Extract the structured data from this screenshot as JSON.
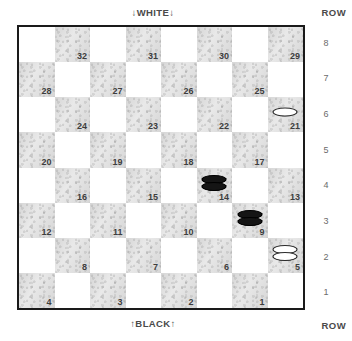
{
  "board": {
    "top_label": "↓WHITE↓",
    "bottom_label": "↑BLACK↑",
    "row_word_top": "ROW",
    "row_word_bottom": "ROW",
    "row_numbers": [
      "8",
      "7",
      "6",
      "5",
      "4",
      "3",
      "2",
      "1"
    ],
    "columns": 8,
    "rows": 8,
    "border_color": "#1a1a1a",
    "dark_square_color": "#e9e9e9",
    "light_square_color": "#ffffff",
    "square_number_color": "#3d3d3d",
    "squares": [
      {
        "num": "32",
        "row": 8,
        "col": 2
      },
      {
        "num": "31",
        "row": 8,
        "col": 4
      },
      {
        "num": "30",
        "row": 8,
        "col": 6
      },
      {
        "num": "29",
        "row": 8,
        "col": 8
      },
      {
        "num": "28",
        "row": 7,
        "col": 1
      },
      {
        "num": "27",
        "row": 7,
        "col": 3
      },
      {
        "num": "26",
        "row": 7,
        "col": 5
      },
      {
        "num": "25",
        "row": 7,
        "col": 7
      },
      {
        "num": "24",
        "row": 6,
        "col": 2
      },
      {
        "num": "23",
        "row": 6,
        "col": 4
      },
      {
        "num": "22",
        "row": 6,
        "col": 6
      },
      {
        "num": "21",
        "row": 6,
        "col": 8
      },
      {
        "num": "20",
        "row": 5,
        "col": 1
      },
      {
        "num": "19",
        "row": 5,
        "col": 3
      },
      {
        "num": "18",
        "row": 5,
        "col": 5
      },
      {
        "num": "17",
        "row": 5,
        "col": 7
      },
      {
        "num": "16",
        "row": 4,
        "col": 2
      },
      {
        "num": "15",
        "row": 4,
        "col": 4
      },
      {
        "num": "14",
        "row": 4,
        "col": 6
      },
      {
        "num": "13",
        "row": 4,
        "col": 8
      },
      {
        "num": "12",
        "row": 3,
        "col": 1
      },
      {
        "num": "11",
        "row": 3,
        "col": 3
      },
      {
        "num": "10",
        "row": 3,
        "col": 5
      },
      {
        "num": "9",
        "row": 3,
        "col": 7
      },
      {
        "num": "8",
        "row": 2,
        "col": 2
      },
      {
        "num": "7",
        "row": 2,
        "col": 4
      },
      {
        "num": "6",
        "row": 2,
        "col": 6
      },
      {
        "num": "5",
        "row": 2,
        "col": 8
      },
      {
        "num": "4",
        "row": 1,
        "col": 1
      },
      {
        "num": "3",
        "row": 1,
        "col": 3
      },
      {
        "num": "2",
        "row": 1,
        "col": 5
      },
      {
        "num": "1",
        "row": 1,
        "col": 7
      }
    ],
    "pieces": [
      {
        "square": "21",
        "color": "white",
        "stack": 1
      },
      {
        "square": "14",
        "color": "black",
        "stack": 2
      },
      {
        "square": "9",
        "color": "black",
        "stack": 2
      },
      {
        "square": "5",
        "color": "white",
        "stack": 2
      }
    ]
  }
}
